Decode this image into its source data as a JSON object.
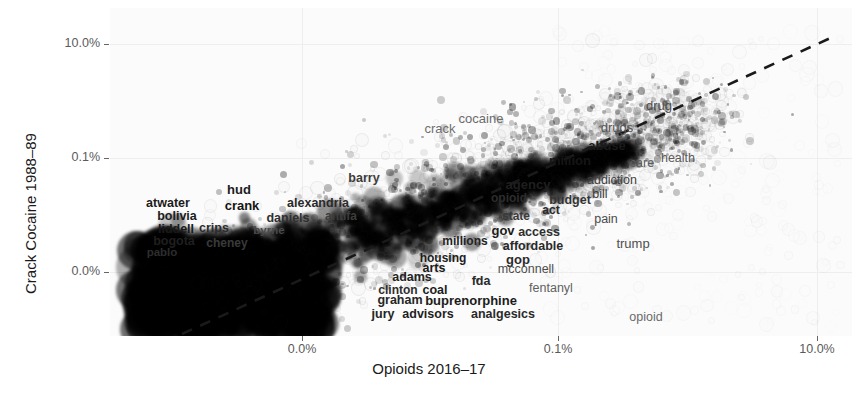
{
  "chart_data": {
    "type": "scatter",
    "title": "",
    "xlabel": "Opioids 2016–17",
    "ylabel": "Crack Cocaine 1988–89",
    "grid": true,
    "legend": null,
    "x_scale": "log-like percent",
    "y_scale": "log-like percent",
    "xticks": [
      {
        "label": "0.0%",
        "px": 302
      },
      {
        "label": "0.1%",
        "px": 558
      },
      {
        "label": "10.0%",
        "px": 817
      }
    ],
    "yticks": [
      {
        "label": "10.0%",
        "px": 44
      },
      {
        "label": "0.1%",
        "px": 158
      },
      {
        "label": "0.0%",
        "px": 272
      }
    ],
    "trendline": {
      "style": "dashed",
      "color": "#1a1a1a",
      "x1": 182,
      "y1": 334,
      "x2": 837,
      "y2": 35
    },
    "n_points_approx": 14000,
    "labeled_points": [
      {
        "word": "atwater",
        "x": 168,
        "y": 203,
        "size": 12.5,
        "weight": "bold",
        "color": "#1c1c1c"
      },
      {
        "word": "hud",
        "x": 239,
        "y": 189,
        "size": 13,
        "weight": "bold",
        "color": "#1c1c1c"
      },
      {
        "word": "crank",
        "x": 242,
        "y": 205,
        "size": 13,
        "weight": "bold",
        "color": "#141414"
      },
      {
        "word": "alexandria",
        "x": 318,
        "y": 203,
        "size": 12.5,
        "weight": "bold",
        "color": "#2a2a2a"
      },
      {
        "word": "bolivia",
        "x": 177,
        "y": 216,
        "size": 12.5,
        "weight": "bold",
        "color": "#1c1c1c"
      },
      {
        "word": "daniels",
        "x": 288,
        "y": 218,
        "size": 12.5,
        "weight": "bold",
        "color": "#2f2f2f"
      },
      {
        "word": "antifa",
        "x": 341,
        "y": 216,
        "size": 12,
        "weight": "bold",
        "color": "#3d3d3d"
      },
      {
        "word": "liddell",
        "x": 176,
        "y": 229,
        "size": 12.5,
        "weight": "bold",
        "color": "#1a1a1a"
      },
      {
        "word": "crips",
        "x": 214,
        "y": 228,
        "size": 12.5,
        "weight": "bold",
        "color": "#2b2b2b"
      },
      {
        "word": "byrne",
        "x": 269,
        "y": 231,
        "size": 11.5,
        "weight": "bold",
        "color": "#4a4a4a"
      },
      {
        "word": "bogota",
        "x": 174,
        "y": 241,
        "size": 12.5,
        "weight": "bold",
        "color": "#1f1f1f"
      },
      {
        "word": "cheney",
        "x": 227,
        "y": 243,
        "size": 12,
        "weight": "bold",
        "color": "#3a3a3a"
      },
      {
        "word": "pablo",
        "x": 162,
        "y": 253,
        "size": 11.5,
        "weight": "bold",
        "color": "#2d2d2d"
      },
      {
        "word": "barry",
        "x": 364,
        "y": 178,
        "size": 12.5,
        "weight": "bold",
        "color": "#3c3c3c"
      },
      {
        "word": "crack",
        "x": 440,
        "y": 128,
        "size": 13,
        "weight": "normal",
        "color": "#6e6e6e"
      },
      {
        "word": "cocaine",
        "x": 481,
        "y": 118,
        "size": 13,
        "weight": "normal",
        "color": "#6a6a6a"
      },
      {
        "word": "drugs",
        "x": 617,
        "y": 127,
        "size": 13,
        "weight": "normal",
        "color": "#555555"
      },
      {
        "word": "drug",
        "x": 659,
        "y": 105,
        "size": 13,
        "weight": "normal",
        "color": "#4d4d4d"
      },
      {
        "word": "abuse",
        "x": 607,
        "y": 145,
        "size": 13,
        "weight": "bold",
        "color": "#1a1a1a"
      },
      {
        "word": "million",
        "x": 570,
        "y": 160,
        "size": 13,
        "weight": "bold",
        "color": "#151515"
      },
      {
        "word": "care",
        "x": 642,
        "y": 163,
        "size": 12.5,
        "weight": "normal",
        "color": "#5c5c5c"
      },
      {
        "word": "health",
        "x": 678,
        "y": 158,
        "size": 12.5,
        "weight": "normal",
        "color": "#5a5a5a"
      },
      {
        "word": "addiction",
        "x": 612,
        "y": 180,
        "size": 12.5,
        "weight": "normal",
        "color": "#414141"
      },
      {
        "word": "bill",
        "x": 600,
        "y": 194,
        "size": 12.5,
        "weight": "normal",
        "color": "#3b3b3b"
      },
      {
        "word": "agency",
        "x": 528,
        "y": 184,
        "size": 13,
        "weight": "bold",
        "color": "#1f1f1f"
      },
      {
        "word": "opioid",
        "x": 509,
        "y": 198,
        "size": 12,
        "weight": "bold",
        "color": "#2d2d2d"
      },
      {
        "word": "budget",
        "x": 570,
        "y": 200,
        "size": 12.5,
        "weight": "bold",
        "color": "#343434"
      },
      {
        "word": "act",
        "x": 551,
        "y": 210,
        "size": 12,
        "weight": "bold",
        "color": "#2a2a2a"
      },
      {
        "word": "state",
        "x": 516,
        "y": 216,
        "size": 12,
        "weight": "bold",
        "color": "#3a3a3a"
      },
      {
        "word": "pain",
        "x": 606,
        "y": 219,
        "size": 12.5,
        "weight": "normal",
        "color": "#4a4a4a"
      },
      {
        "word": "gov",
        "x": 503,
        "y": 230,
        "size": 13,
        "weight": "bold",
        "color": "#1c1c1c"
      },
      {
        "word": "access",
        "x": 539,
        "y": 232,
        "size": 12.5,
        "weight": "bold",
        "color": "#2e2e2e"
      },
      {
        "word": "trump",
        "x": 633,
        "y": 243,
        "size": 13,
        "weight": "normal",
        "color": "#4f4f4f"
      },
      {
        "word": "millions",
        "x": 465,
        "y": 241,
        "size": 12,
        "weight": "bold",
        "color": "#232323"
      },
      {
        "word": "affordable",
        "x": 533,
        "y": 246,
        "size": 12.5,
        "weight": "bold",
        "color": "#2a2a2a"
      },
      {
        "word": "gop",
        "x": 518,
        "y": 259,
        "size": 13,
        "weight": "bold",
        "color": "#2b2b2b"
      },
      {
        "word": "housing",
        "x": 443,
        "y": 258,
        "size": 12,
        "weight": "bold",
        "color": "#1e1e1e"
      },
      {
        "word": "arts",
        "x": 434,
        "y": 268,
        "size": 12.5,
        "weight": "bold",
        "color": "#1a1a1a"
      },
      {
        "word": "mcconnell",
        "x": 526,
        "y": 269,
        "size": 12.5,
        "weight": "normal",
        "color": "#4d4d4d"
      },
      {
        "word": "adams",
        "x": 412,
        "y": 277,
        "size": 12.5,
        "weight": "bold",
        "color": "#232323"
      },
      {
        "word": "fda",
        "x": 481,
        "y": 281,
        "size": 12.5,
        "weight": "bold",
        "color": "#2b2b2b"
      },
      {
        "word": "coal",
        "x": 435,
        "y": 290,
        "size": 12.5,
        "weight": "bold",
        "color": "#1d1d1d"
      },
      {
        "word": "clinton",
        "x": 398,
        "y": 290,
        "size": 12,
        "weight": "bold",
        "color": "#2e2e2e"
      },
      {
        "word": "fentanyl",
        "x": 551,
        "y": 288,
        "size": 12.5,
        "weight": "normal",
        "color": "#616161"
      },
      {
        "word": "graham",
        "x": 400,
        "y": 300,
        "size": 12.5,
        "weight": "bold",
        "color": "#262626"
      },
      {
        "word": "buprenorphine",
        "x": 471,
        "y": 300,
        "size": 13,
        "weight": "bold",
        "color": "#1b1b1b"
      },
      {
        "word": "jury",
        "x": 383,
        "y": 314,
        "size": 12.5,
        "weight": "bold",
        "color": "#242424"
      },
      {
        "word": "advisors",
        "x": 428,
        "y": 314,
        "size": 12.5,
        "weight": "bold",
        "color": "#1f1f1f"
      },
      {
        "word": "analgesics",
        "x": 503,
        "y": 314,
        "size": 12.5,
        "weight": "bold",
        "color": "#2a2a2a"
      },
      {
        "word": "opioid",
        "x": 646,
        "y": 317,
        "size": 12.5,
        "weight": "normal",
        "color": "#6a6a6a"
      }
    ]
  }
}
